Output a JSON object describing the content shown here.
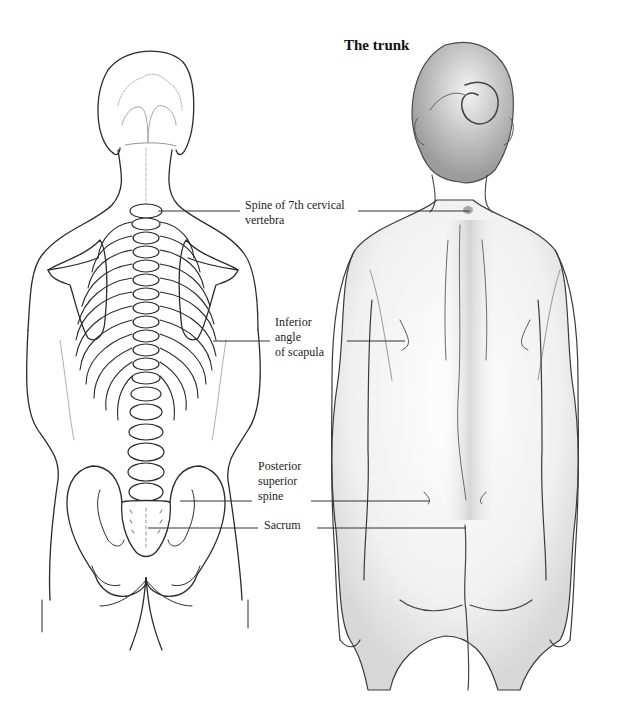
{
  "figure": {
    "title": "The trunk",
    "left_panel": "skeleton-posterior-view",
    "right_panel": "figure-posterior-view",
    "colors": {
      "background": "#ffffff",
      "line_art": "#2a2a2a",
      "shading": "#8a8a8a",
      "leader_line": "#333333",
      "text": "#1a1a1a"
    }
  },
  "labels": {
    "c7": {
      "line1": "Spine of 7th cervical",
      "line2": "vertebra"
    },
    "scapula": {
      "line1": "Inferior",
      "line2": "angle",
      "line3": "of scapula"
    },
    "pss": {
      "line1": "Posterior",
      "line2": "superior",
      "line3": "spine"
    },
    "sacrum": {
      "line1": "Sacrum"
    }
  },
  "leader_lines": [
    {
      "name": "c7",
      "left": [
        158,
        211,
        240,
        211
      ],
      "right": [
        358,
        211,
        470,
        211
      ]
    },
    {
      "name": "scapula",
      "left": [
        213,
        341,
        270,
        341
      ],
      "right": [
        347,
        341,
        405,
        341
      ]
    },
    {
      "name": "pss",
      "left": [
        180,
        501,
        252,
        501
      ],
      "right": [
        311,
        501,
        430,
        501
      ]
    },
    {
      "name": "sacrum",
      "left": [
        148,
        528,
        258,
        528
      ],
      "right": [
        317,
        528,
        466,
        528
      ]
    }
  ]
}
